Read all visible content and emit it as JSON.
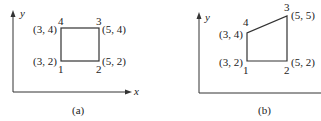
{
  "figure_a": {
    "caption": "(a)",
    "x_axis_label": "x",
    "y_axis_label": "y",
    "shape": "rectangle",
    "vertices": [
      {
        "id": "1",
        "coord": "(3, 2)"
      },
      {
        "id": "2",
        "coord": "(5, 2)"
      },
      {
        "id": "3",
        "coord": "(5, 4)"
      },
      {
        "id": "4",
        "coord": "(3, 4)"
      }
    ]
  },
  "figure_b": {
    "caption": "(b)",
    "y_axis_label": "y",
    "shape": "quadrilateral",
    "vertices": [
      {
        "id": "1",
        "coord": "(3, 2)"
      },
      {
        "id": "2",
        "coord": "(5, 2)"
      },
      {
        "id": "3",
        "coord": "(5, 5)"
      },
      {
        "id": "4",
        "coord": "(3, 4)"
      }
    ]
  },
  "colors": {
    "line": "#333333",
    "text": "#222222",
    "background": "#ffffff"
  }
}
